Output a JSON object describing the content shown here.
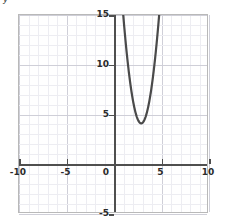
{
  "axis_caption": "y",
  "chart_data": {
    "type": "line",
    "title": "",
    "xlabel": "",
    "ylabel": "y",
    "xlim": [
      -10,
      10
    ],
    "ylim": [
      -5,
      15
    ],
    "grid": true,
    "grid_major_step": 5,
    "grid_minor_step": 1,
    "legend": "none",
    "curve_color": "#4a4a4a",
    "axis_color": "#4f4f4f",
    "equation": "y = 3(x - 3)^2 + 4",
    "vertex": [
      3,
      4
    ],
    "x_ticks": [
      -10,
      -5,
      0,
      5,
      10
    ],
    "x_tick_labels": [
      "-10",
      "-5",
      "0",
      "5",
      "10"
    ],
    "y_ticks": [
      -5,
      5,
      10,
      15
    ],
    "y_tick_labels": [
      "-5",
      "5",
      "10",
      "15"
    ],
    "origin_label": "0",
    "series": [
      {
        "name": "parabola",
        "x": [
          1.09,
          1.2,
          1.4,
          1.6,
          1.8,
          2.0,
          2.2,
          2.4,
          2.6,
          2.8,
          3.0,
          3.2,
          3.4,
          3.6,
          3.8,
          4.0,
          4.2,
          4.4,
          4.6,
          4.8,
          4.91
        ],
        "y": [
          15.0,
          13.72,
          11.68,
          9.88,
          12.32,
          7.0,
          5.92,
          5.08,
          4.48,
          4.12,
          4.0,
          4.12,
          4.48,
          5.08,
          5.92,
          7.0,
          8.32,
          9.88,
          11.68,
          13.72,
          15.0
        ]
      }
    ]
  }
}
